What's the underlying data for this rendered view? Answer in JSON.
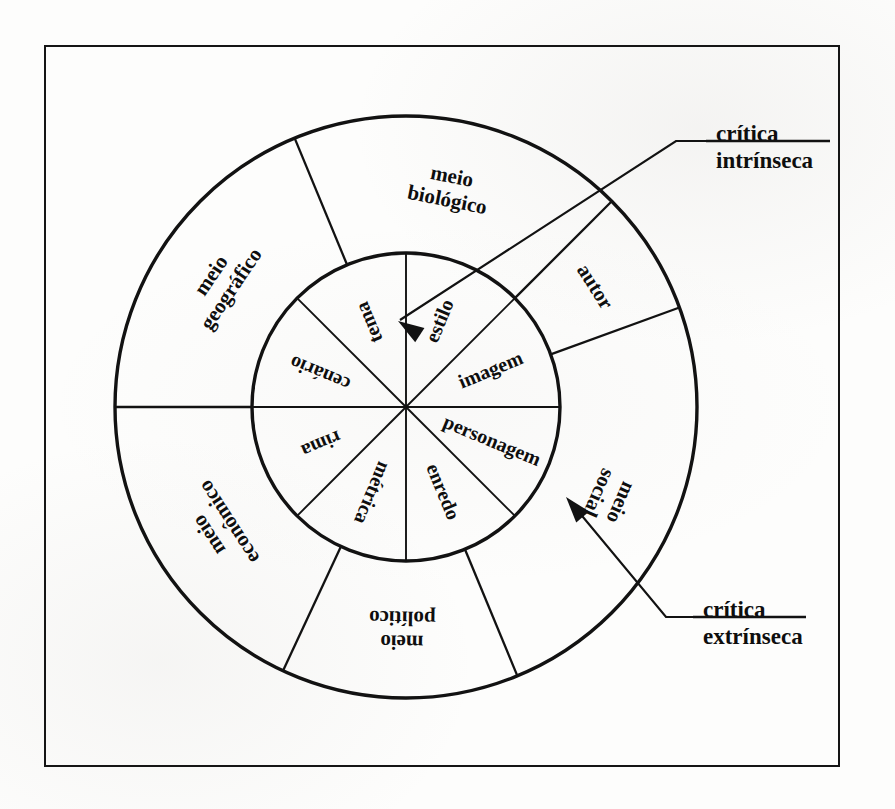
{
  "figure": {
    "type": "concentric-wheel-diagram",
    "title_visible": false,
    "center": {
      "x": 406,
      "y": 407
    },
    "inner_radius": 154,
    "outer_radius": 291,
    "frame": {
      "x": 44,
      "y": 45,
      "w": 792,
      "h": 718
    }
  },
  "inner_ring": {
    "name": "critica-intrinseca-elements",
    "sector_count": 8,
    "sector_span_deg": 45,
    "segments": [
      {
        "label": "tema",
        "mid_angle_deg": -112.5
      },
      {
        "label": "estilo",
        "mid_angle_deg": -67.5
      },
      {
        "label": "imagem",
        "mid_angle_deg": -22.5
      },
      {
        "label": "personagem",
        "mid_angle_deg": 22.5
      },
      {
        "label": "enredo",
        "mid_angle_deg": 67.5
      },
      {
        "label": "métrica",
        "mid_angle_deg": 112.5
      },
      {
        "label": "rima",
        "mid_angle_deg": 157.5
      },
      {
        "label": "cenário",
        "mid_angle_deg": -157.5
      }
    ]
  },
  "outer_ring": {
    "name": "critica-extrinseca-contexts",
    "sector_count": 6,
    "segments": [
      {
        "label": "meio biológico",
        "start_deg": -112.5,
        "end_deg": -45,
        "mid_angle_deg": -78.75,
        "lines": [
          "meio",
          "biológico"
        ]
      },
      {
        "label": "autor",
        "start_deg": -45,
        "end_deg": -20,
        "mid_angle_deg": -32.5,
        "lines": [
          "autor"
        ]
      },
      {
        "label": "meio social",
        "start_deg": -20,
        "end_deg": 67.5,
        "mid_angle_deg": 24,
        "lines": [
          "meio",
          "social"
        ]
      },
      {
        "label": "meio político",
        "start_deg": 67.5,
        "end_deg": 115,
        "mid_angle_deg": 91,
        "lines": [
          "meio",
          "político"
        ]
      },
      {
        "label": "meio econômico",
        "start_deg": 115,
        "end_deg": 180,
        "mid_angle_deg": 147,
        "lines": [
          "meio",
          "econômico"
        ]
      },
      {
        "label": "meio geográfico",
        "start_deg": 180,
        "end_deg": -112.5,
        "mid_angle_deg": -146,
        "lines": [
          "meio",
          "geográfico"
        ]
      }
    ]
  },
  "callouts": [
    {
      "id": "critica-intrinseca",
      "lines": [
        "crítica",
        "intrínseca"
      ],
      "label_x": 716,
      "label_y": 136,
      "underline_y": 141,
      "underline_x1": 706,
      "underline_x2": 830,
      "leader": "M 706 141 L 676 141 L 400 320",
      "arrow_tip": {
        "x": 398,
        "y": 321
      },
      "arrow_angle_deg": 213,
      "points_to": "tema"
    },
    {
      "id": "critica-extrinseca",
      "lines": [
        "crítica",
        "extrínseca"
      ],
      "label_x": 703,
      "label_y": 612,
      "underline_y": 617,
      "underline_x1": 693,
      "underline_x2": 806,
      "leader": "M 693 617 L 666 617 L 573 505",
      "arrow_tip": {
        "x": 566,
        "y": 497
      },
      "arrow_angle_deg": 230,
      "points_to": "meio social"
    }
  ],
  "colors": {
    "ink": "#121212",
    "paper": "#fdfdfc"
  },
  "strokes": {
    "outer_circle": 3.4,
    "inner_circle": 3.4,
    "inner_divider": 1.9,
    "outer_divider": 2.3,
    "frame": 2
  }
}
